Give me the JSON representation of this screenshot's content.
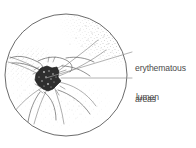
{
  "figure": {
    "type": "medical-illustration",
    "view": "circular endoscopic view",
    "style": "pen-and-ink stipple drawing",
    "colors": {
      "background": "#ffffff",
      "outline": "#5a5a5a",
      "stipple": "#8d8d8d",
      "lumen_fill": "#2e2e2e",
      "leader_line": "#9a9a9a",
      "label_text": "#4b4b4b"
    },
    "circle": {
      "center_x": 66,
      "center_y": 75,
      "radius": 61
    },
    "lumen_blob": {
      "center_x": 47,
      "center_y": 80,
      "radius": 13
    }
  },
  "annotations": [
    {
      "id": "erythematous-areas",
      "line1": "erythematous",
      "line2": "areas",
      "leader": {
        "label_x": 133,
        "label_y": 52,
        "target_x": 45,
        "target_y": 78
      }
    },
    {
      "id": "lumen",
      "line1": "lumen",
      "leader": {
        "label_x": 133,
        "label_y": 78,
        "target_x": 60,
        "target_y": 78
      }
    }
  ]
}
